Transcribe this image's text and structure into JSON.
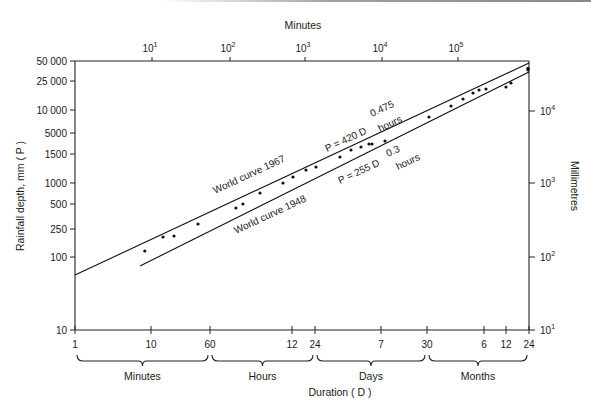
{
  "chart_data": {
    "type": "line",
    "title": "",
    "xlabel": "Duration ( D )",
    "ylabel": "Rainfall depth, mm ( P )",
    "x2label": "Minutes",
    "y2label": "Millimetres",
    "xscale": "log",
    "yscale": "log",
    "xlim_minutes": [
      1,
      1051200
    ],
    "ylim": [
      10,
      50000
    ],
    "grid": false,
    "legend_position": "inline annotations",
    "left_y_ticks": [
      {
        "label": "50 000",
        "y": 61
      },
      {
        "label": "25 000",
        "y": 81
      },
      {
        "label": "10 000",
        "y": 110
      },
      {
        "label": "5000",
        "y": 133
      },
      {
        "label": "1500",
        "y": 154
      },
      {
        "label": "1000",
        "y": 183
      },
      {
        "label": "500",
        "y": 204
      },
      {
        "label": "250",
        "y": 229
      },
      {
        "label": "100",
        "y": 257
      },
      {
        "label": "10",
        "y": 330
      }
    ],
    "right_y_ticks": [
      {
        "base": "10",
        "exp": "4",
        "y": 111
      },
      {
        "base": "10",
        "exp": "3",
        "y": 183
      },
      {
        "base": "10",
        "exp": "2",
        "y": 257
      },
      {
        "base": "10",
        "exp": "1",
        "y": 330
      }
    ],
    "top_x_ticks": [
      {
        "base": "10",
        "exp": "1",
        "x": 152
      },
      {
        "base": "10",
        "exp": "2",
        "x": 230
      },
      {
        "base": "10",
        "exp": "3",
        "x": 305
      },
      {
        "base": "10",
        "exp": "4",
        "x": 382
      },
      {
        "base": "10",
        "exp": "5",
        "x": 458
      }
    ],
    "bottom_x_ticks": [
      {
        "label": "1",
        "x": 75
      },
      {
        "label": "10",
        "x": 151
      },
      {
        "label": "60",
        "x": 210
      },
      {
        "label": "12",
        "x": 292
      },
      {
        "label": "24",
        "x": 315
      },
      {
        "label": "7",
        "x": 381
      },
      {
        "label": "30",
        "x": 427
      },
      {
        "label": "6",
        "x": 484
      },
      {
        "label": "12",
        "x": 506
      },
      {
        "label": "24",
        "x": 529
      }
    ],
    "duration_groups": [
      {
        "label": "Minutes",
        "x1": 77,
        "x2": 208
      },
      {
        "label": "Hours",
        "x1": 212,
        "x2": 313
      },
      {
        "label": "Days",
        "x1": 317,
        "x2": 425
      },
      {
        "label": "Months",
        "x1": 429,
        "x2": 527
      }
    ],
    "series": [
      {
        "name": "World curve 1967",
        "equation": "P = 420 D^0.475 hours",
        "coefficient": 420,
        "exponent": 0.475,
        "x_minutes": [
          1,
          1051200
        ],
        "values": [
          57,
          43300
        ]
      },
      {
        "name": "World curve 1948",
        "equation": "P = 255 D^0.3 hours",
        "coefficient": 255,
        "exponent": 0.3,
        "x_minutes": [
          7,
          1051200
        ],
        "values": [
          80,
          33000
        ]
      },
      {
        "name": "Observed maximum rainfalls",
        "type": "scatter",
        "x_minutes": [
          8.3,
          14.4,
          20.1,
          41.5,
          131,
          162,
          272,
          545,
          738,
          1094,
          1483,
          3069,
          4285,
          5800,
          7385,
          8087,
          11990,
          45470,
          88500,
          127300,
          172500,
          206900,
          256000,
          469000,
          546000,
          914000,
          914000
        ],
        "values": [
          121,
          188,
          194,
          283,
          469,
          532,
          753,
          1033,
          1248,
          1556,
          1711,
          2344,
          2926,
          3217,
          3532,
          3532,
          3882,
          8283,
          11700,
          14590,
          17650,
          19400,
          20000,
          21300,
          24200,
          36500,
          38500
        ]
      }
    ],
    "annotations": [
      {
        "text": "World curve 1967",
        "x": 210,
        "y": 188
      },
      {
        "text": "World curve 1948",
        "x": 236,
        "y": 234
      },
      {
        "text": "P = 420 D",
        "x": 327,
        "y": 150
      },
      {
        "text": "0.475",
        "x": 375,
        "y": 113
      },
      {
        "text": "hours",
        "x": 384,
        "y": 128
      },
      {
        "text": "P = 255 D",
        "x": 340,
        "y": 183
      },
      {
        "text": "0.3",
        "x": 390,
        "y": 155
      },
      {
        "text": "hours",
        "x": 401,
        "y": 166
      }
    ]
  },
  "labels": {
    "top_axis_title": "Minutes",
    "left_axis_title": "Rainfall depth, mm ( P )",
    "right_axis_title": "Millimetres",
    "bottom_axis_title": "Duration ( D )",
    "curve_1967": "World curve 1967",
    "curve_1948": "World curve 1948",
    "eq1967_main": "P = 420 D",
    "eq1967_exp": "0.475",
    "eq1967_unit": "hours",
    "eq1948_main": "P = 255 D",
    "eq1948_exp": "0.3",
    "eq1948_unit": "hours"
  }
}
